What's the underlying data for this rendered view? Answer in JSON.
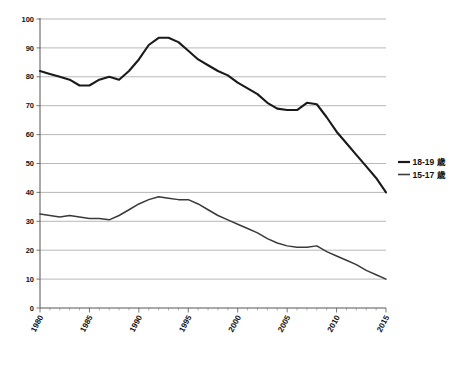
{
  "chart_data": {
    "type": "line",
    "title": "",
    "xlabel": "",
    "ylabel": "",
    "xlim": [
      1980,
      2015
    ],
    "ylim": [
      0,
      100
    ],
    "grid": true,
    "legend_position": "right",
    "x": [
      1980,
      1981,
      1982,
      1983,
      1984,
      1985,
      1986,
      1987,
      1988,
      1989,
      1990,
      1991,
      1992,
      1993,
      1994,
      1995,
      1996,
      1997,
      1998,
      1999,
      2000,
      2001,
      2002,
      2003,
      2004,
      2005,
      2006,
      2007,
      2008,
      2009,
      2010,
      2011,
      2012,
      2013,
      2014,
      2015
    ],
    "xtick_labels": [
      "1980",
      "1985",
      "1990",
      "1995",
      "2000",
      "2005",
      "2010",
      "2015"
    ],
    "xtick_values": [
      1980,
      1985,
      1990,
      1995,
      2000,
      2005,
      2010,
      2015
    ],
    "ytick_labels": [
      "0",
      "10",
      "20",
      "30",
      "40",
      "50",
      "60",
      "70",
      "80",
      "90",
      "100"
    ],
    "ytick_values": [
      0,
      10,
      20,
      30,
      40,
      50,
      60,
      70,
      80,
      90,
      100
    ],
    "series": [
      {
        "name": "18-19 歳",
        "color": "#1a1a1a",
        "values": [
          82,
          81,
          80,
          79,
          77,
          77,
          79,
          80,
          79,
          82,
          86,
          91,
          93.5,
          93.5,
          92,
          89,
          86,
          84,
          82,
          80.5,
          78,
          76,
          74,
          71,
          69,
          68.5,
          68.5,
          71,
          70.5,
          66,
          61,
          57,
          53,
          49,
          45,
          40
        ]
      },
      {
        "name": "15-17 歳",
        "color": "#3a3a3a",
        "values": [
          32.5,
          32,
          31.5,
          32,
          31.5,
          31,
          31,
          30.5,
          32,
          34,
          36,
          37.5,
          38.5,
          38,
          37.5,
          37.5,
          36,
          34,
          32,
          30.5,
          29,
          27.5,
          26,
          24,
          22.5,
          21.5,
          21,
          21,
          21.5,
          19.5,
          18,
          16.5,
          15,
          13,
          11.5,
          10
        ]
      }
    ]
  },
  "legend": {
    "items": [
      {
        "label": "18-19 歳"
      },
      {
        "label": "15-17 歳"
      }
    ]
  },
  "caption": {
    "text": ""
  }
}
